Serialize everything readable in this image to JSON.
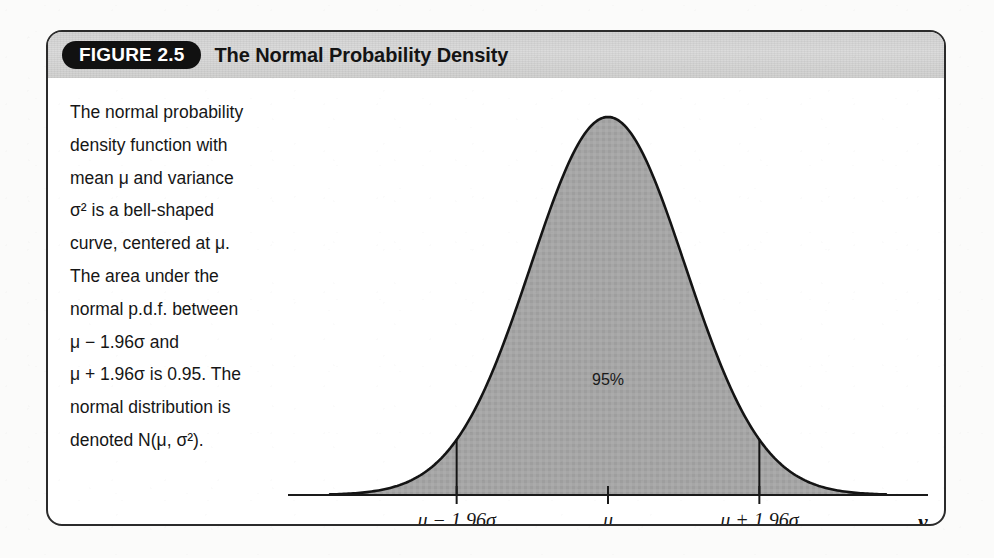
{
  "figure": {
    "badge": "FIGURE 2.5",
    "title": "The Normal Probability Density",
    "caption_lines": [
      "The normal probability",
      "density function with",
      "mean μ and variance",
      "σ² is a bell-shaped",
      "curve, centered at μ.",
      "The area under the",
      "normal p.d.f. between",
      "μ − 1.96σ and",
      "μ + 1.96σ is 0.95. The",
      "normal distribution is",
      "denoted N(μ, σ²)."
    ]
  },
  "chart_data": {
    "type": "line",
    "title": "The Normal Probability Density",
    "xlabel": "y",
    "ylabel": "",
    "grid": false,
    "legend": null,
    "distribution": "normal",
    "mean_symbol": "μ",
    "sd_symbol": "σ",
    "fill_color": "#a3a3a3",
    "line_color": "#141414",
    "axis_color": "#1a1a1a",
    "xlim": [
      -3.6,
      3.6
    ],
    "ylim": [
      0,
      0.42
    ],
    "tick_values": [
      -1.96,
      0,
      1.96
    ],
    "tick_labels": [
      "μ − 1.96σ",
      "μ",
      "μ + 1.96σ"
    ],
    "annotations": [
      {
        "text": "95%",
        "x": 0,
        "y": 0.12,
        "note": "central probability mass between μ−1.96σ and μ+1.96σ"
      }
    ],
    "shaded_interval": [
      -1.96,
      1.96
    ],
    "shaded_area": 0.95,
    "x": [
      -3.6,
      -3.4,
      -3.2,
      -3.0,
      -2.8,
      -2.6,
      -2.4,
      -2.2,
      -2.0,
      -1.96,
      -1.8,
      -1.6,
      -1.4,
      -1.2,
      -1.0,
      -0.8,
      -0.6,
      -0.4,
      -0.2,
      0.0,
      0.2,
      0.4,
      0.6,
      0.8,
      1.0,
      1.2,
      1.4,
      1.6,
      1.8,
      1.96,
      2.0,
      2.2,
      2.4,
      2.6,
      2.8,
      3.0,
      3.2,
      3.4,
      3.6
    ],
    "y": [
      0.0006,
      0.0012,
      0.0024,
      0.0044,
      0.0079,
      0.0136,
      0.0224,
      0.0355,
      0.054,
      0.0584,
      0.079,
      0.1109,
      0.1497,
      0.1942,
      0.242,
      0.2897,
      0.3332,
      0.3683,
      0.391,
      0.3989,
      0.391,
      0.3683,
      0.3332,
      0.2897,
      0.242,
      0.1942,
      0.1497,
      0.1109,
      0.079,
      0.0584,
      0.054,
      0.0355,
      0.0224,
      0.0136,
      0.0079,
      0.0044,
      0.0024,
      0.0012,
      0.0006
    ]
  }
}
